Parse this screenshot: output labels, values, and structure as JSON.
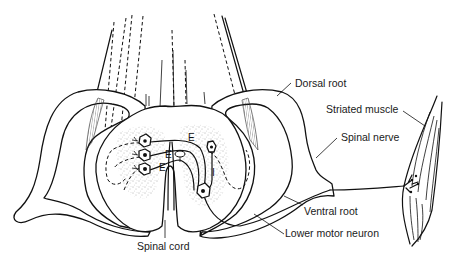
{
  "diagram": {
    "labels": {
      "dorsal_root": "Dorsal root",
      "striated_muscle": "Striated muscle",
      "spinal_nerve": "Spinal nerve",
      "ventral_root": "Ventral root",
      "lower_motor_neuron": "Lower motor neuron",
      "spinal_cord": "Spinal cord"
    },
    "synapse_markers": {
      "excitatory_1": "E",
      "excitatory_2": "E",
      "excitatory_3": "E",
      "excitatory_4": "E",
      "inhibitory": "I"
    },
    "colors": {
      "line": "#111111",
      "background": "#ffffff",
      "stipple": "#555555"
    }
  }
}
